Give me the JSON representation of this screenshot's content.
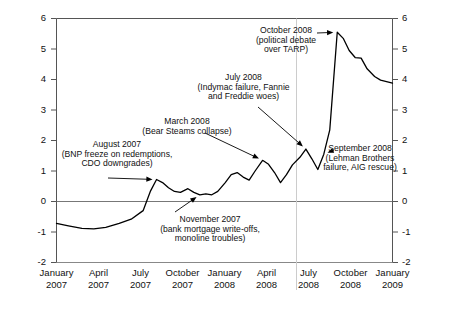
{
  "chart_data": {
    "type": "line",
    "title": "",
    "subtitle": "",
    "xlabel": "",
    "ylabel": "",
    "xlim": [
      "January 2007",
      "April 2009"
    ],
    "ylim": [
      -2,
      6
    ],
    "yticks": [
      -2,
      -1,
      0,
      1,
      2,
      3,
      4,
      5,
      6
    ],
    "ytick_labels_left": [
      "6",
      "5",
      "4",
      "3",
      "2",
      "1",
      "0",
      "-1",
      "-2"
    ],
    "ytick_labels_right": [
      "6",
      "5",
      "4",
      "3",
      "2",
      "1",
      "0",
      "-1",
      "-2"
    ],
    "xtick_labels": [
      {
        "month": "January",
        "year": "2007"
      },
      {
        "month": "April",
        "year": "2007"
      },
      {
        "month": "July",
        "year": "2007"
      },
      {
        "month": "October",
        "year": "2007"
      },
      {
        "month": "January",
        "year": "2008"
      },
      {
        "month": "April",
        "year": "2008"
      },
      {
        "month": "July",
        "year": "2008"
      },
      {
        "month": "October",
        "year": "2008"
      },
      {
        "month": "January",
        "year": "2009"
      }
    ],
    "grid": false,
    "zero_line": true,
    "vertical_reference_line": "July 2008",
    "legend": null,
    "line_color": "#000000",
    "series": [
      {
        "name": "index",
        "points": [
          {
            "x": 0.0,
            "y": -0.72
          },
          {
            "x": 0.08,
            "y": -0.8
          },
          {
            "x": 0.17,
            "y": -0.88
          },
          {
            "x": 0.25,
            "y": -0.9
          },
          {
            "x": 0.33,
            "y": -0.85
          },
          {
            "x": 0.42,
            "y": -0.72
          },
          {
            "x": 0.5,
            "y": -0.58
          },
          {
            "x": 0.58,
            "y": -0.3
          },
          {
            "x": 0.63,
            "y": 0.35
          },
          {
            "x": 0.67,
            "y": 0.72
          },
          {
            "x": 0.71,
            "y": 0.62
          },
          {
            "x": 0.75,
            "y": 0.45
          },
          {
            "x": 0.79,
            "y": 0.33
          },
          {
            "x": 0.83,
            "y": 0.3
          },
          {
            "x": 0.88,
            "y": 0.42
          },
          {
            "x": 0.92,
            "y": 0.3
          },
          {
            "x": 0.96,
            "y": 0.22
          },
          {
            "x": 1.0,
            "y": 0.25
          },
          {
            "x": 1.04,
            "y": 0.22
          },
          {
            "x": 1.08,
            "y": 0.33
          },
          {
            "x": 1.13,
            "y": 0.62
          },
          {
            "x": 1.17,
            "y": 0.88
          },
          {
            "x": 1.21,
            "y": 0.95
          },
          {
            "x": 1.25,
            "y": 0.8
          },
          {
            "x": 1.29,
            "y": 0.7
          },
          {
            "x": 1.33,
            "y": 1.0
          },
          {
            "x": 1.38,
            "y": 1.35
          },
          {
            "x": 1.42,
            "y": 1.22
          },
          {
            "x": 1.46,
            "y": 0.95
          },
          {
            "x": 1.5,
            "y": 0.62
          },
          {
            "x": 1.54,
            "y": 0.88
          },
          {
            "x": 1.58,
            "y": 1.2
          },
          {
            "x": 1.63,
            "y": 1.45
          },
          {
            "x": 1.67,
            "y": 1.72
          },
          {
            "x": 1.71,
            "y": 1.4
          },
          {
            "x": 1.75,
            "y": 1.05
          },
          {
            "x": 1.79,
            "y": 1.55
          },
          {
            "x": 1.83,
            "y": 2.35
          },
          {
            "x": 1.88,
            "y": 5.55
          },
          {
            "x": 1.92,
            "y": 5.35
          },
          {
            "x": 1.96,
            "y": 4.95
          },
          {
            "x": 2.0,
            "y": 4.72
          },
          {
            "x": 2.04,
            "y": 4.7
          },
          {
            "x": 2.08,
            "y": 4.35
          },
          {
            "x": 2.13,
            "y": 4.1
          },
          {
            "x": 2.17,
            "y": 3.98
          },
          {
            "x": 2.25,
            "y": 3.88
          }
        ]
      }
    ],
    "annotations": [
      {
        "id": "aug-2007",
        "lines": [
          "August 2007",
          "(BNP freeze on redemptions,",
          "CDO downgrades)"
        ],
        "target_x": 0.67,
        "target_y": 0.72
      },
      {
        "id": "nov-2007",
        "lines": [
          "November 2007",
          "(bank mortgage write-offs,",
          "monoline troubles)"
        ],
        "target_x": 0.96,
        "target_y": 0.22
      },
      {
        "id": "mar-2008",
        "lines": [
          "March 2008",
          "(Bear Steams collapse)"
        ],
        "target_x": 1.38,
        "target_y": 1.35
      },
      {
        "id": "jul-2008",
        "lines": [
          "July 2008",
          "(Indymac failure, Fannie",
          "and Freddie woes)"
        ],
        "target_x": 1.67,
        "target_y": 1.72
      },
      {
        "id": "sep-2008",
        "lines": [
          "September 2008",
          "(Lehman Brothers",
          "failure, AIG rescue)"
        ],
        "target_x": 1.79,
        "target_y": 1.55
      },
      {
        "id": "oct-2008",
        "lines": [
          "October 2008",
          "(political debate",
          "over TARP)"
        ],
        "target_x": 1.88,
        "target_y": 5.55
      }
    ]
  }
}
